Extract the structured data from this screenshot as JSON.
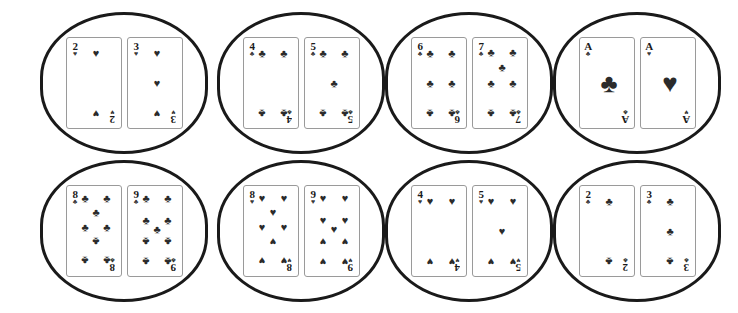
{
  "figure": {
    "background_color": "#ffffff",
    "group_outline_color": "#1a1a1a",
    "card_border_color": "#9a9a9a",
    "pip_color": "#2b2b2b",
    "rows": 2,
    "columns": 4,
    "total_groups": 8,
    "cards_per_group": 2
  },
  "suits": {
    "hearts": "♥",
    "clubs": "♣",
    "spades": "♠",
    "diamonds": "♦"
  },
  "groups": [
    {
      "id": "group-1",
      "row": 1,
      "column": 1,
      "x": 40,
      "y": 12,
      "width": 168,
      "height": 142,
      "cards": [
        {
          "rank": "2",
          "suit": "hearts",
          "suit_symbol": "♥",
          "pip_count": 2,
          "label": "2 of hearts"
        },
        {
          "rank": "3",
          "suit": "hearts",
          "suit_symbol": "♥",
          "pip_count": 3,
          "label": "3 of hearts"
        }
      ]
    },
    {
      "id": "group-2",
      "row": 1,
      "column": 2,
      "x": 217,
      "y": 12,
      "width": 168,
      "height": 142,
      "cards": [
        {
          "rank": "4",
          "suit": "clubs",
          "suit_symbol": "♣",
          "pip_count": 4,
          "label": "4 of clubs"
        },
        {
          "rank": "5",
          "suit": "clubs",
          "suit_symbol": "♣",
          "pip_count": 5,
          "label": "5 of clubs"
        }
      ]
    },
    {
      "id": "group-3",
      "row": 1,
      "column": 3,
      "x": 385,
      "y": 12,
      "width": 168,
      "height": 142,
      "cards": [
        {
          "rank": "6",
          "suit": "clubs",
          "suit_symbol": "♣",
          "pip_count": 6,
          "label": "6 of clubs"
        },
        {
          "rank": "7",
          "suit": "clubs",
          "suit_symbol": "♣",
          "pip_count": 7,
          "label": "7 of clubs"
        }
      ]
    },
    {
      "id": "group-4",
      "row": 1,
      "column": 4,
      "x": 553,
      "y": 12,
      "width": 168,
      "height": 142,
      "cards": [
        {
          "rank": "A",
          "suit": "clubs",
          "suit_symbol": "♣",
          "pip_count": 1,
          "label": "ace of clubs"
        },
        {
          "rank": "A",
          "suit": "hearts",
          "suit_symbol": "♥",
          "pip_count": 1,
          "label": "ace of hearts"
        }
      ]
    },
    {
      "id": "group-5",
      "row": 2,
      "column": 1,
      "x": 40,
      "y": 160,
      "width": 168,
      "height": 142,
      "cards": [
        {
          "rank": "8",
          "suit": "clubs",
          "suit_symbol": "♣",
          "pip_count": 8,
          "label": "8 of clubs"
        },
        {
          "rank": "9",
          "suit": "clubs",
          "suit_symbol": "♣",
          "pip_count": 9,
          "label": "9 of clubs"
        }
      ]
    },
    {
      "id": "group-6",
      "row": 2,
      "column": 2,
      "x": 217,
      "y": 160,
      "width": 168,
      "height": 142,
      "cards": [
        {
          "rank": "8",
          "suit": "hearts",
          "suit_symbol": "♥",
          "pip_count": 8,
          "label": "8 of hearts"
        },
        {
          "rank": "9",
          "suit": "hearts",
          "suit_symbol": "♥",
          "pip_count": 9,
          "label": "9 of hearts"
        }
      ]
    },
    {
      "id": "group-7",
      "row": 2,
      "column": 3,
      "x": 385,
      "y": 160,
      "width": 168,
      "height": 142,
      "cards": [
        {
          "rank": "4",
          "suit": "hearts",
          "suit_symbol": "♥",
          "pip_count": 4,
          "label": "4 of hearts"
        },
        {
          "rank": "5",
          "suit": "hearts",
          "suit_symbol": "♥",
          "pip_count": 5,
          "label": "5 of hearts"
        }
      ]
    },
    {
      "id": "group-8",
      "row": 2,
      "column": 4,
      "x": 553,
      "y": 160,
      "width": 168,
      "height": 142,
      "cards": [
        {
          "rank": "2",
          "suit": "clubs",
          "suit_symbol": "♣",
          "pip_count": 2,
          "label": "2 of clubs"
        },
        {
          "rank": "3",
          "suit": "clubs",
          "suit_symbol": "♣",
          "pip_count": 3,
          "label": "3 of clubs"
        }
      ]
    }
  ],
  "pip_layouts": {
    "1": [
      [
        50,
        50,
        "big",
        false
      ]
    ],
    "2": [
      [
        50,
        14,
        "",
        false
      ],
      [
        50,
        86,
        "",
        true
      ]
    ],
    "3": [
      [
        50,
        14,
        "",
        false
      ],
      [
        50,
        50,
        "",
        false
      ],
      [
        50,
        86,
        "",
        true
      ]
    ],
    "4": [
      [
        22,
        14,
        "",
        false
      ],
      [
        78,
        14,
        "",
        false
      ],
      [
        22,
        86,
        "",
        true
      ],
      [
        78,
        86,
        "",
        true
      ]
    ],
    "5": [
      [
        22,
        14,
        "",
        false
      ],
      [
        78,
        14,
        "",
        false
      ],
      [
        50,
        50,
        "",
        false
      ],
      [
        22,
        86,
        "",
        true
      ],
      [
        78,
        86,
        "",
        true
      ]
    ],
    "6": [
      [
        22,
        14,
        "",
        false
      ],
      [
        78,
        14,
        "",
        false
      ],
      [
        22,
        50,
        "",
        false
      ],
      [
        78,
        50,
        "",
        false
      ],
      [
        22,
        86,
        "",
        true
      ],
      [
        78,
        86,
        "",
        true
      ]
    ],
    "7": [
      [
        22,
        12,
        "",
        false
      ],
      [
        78,
        12,
        "",
        false
      ],
      [
        50,
        30,
        "",
        false
      ],
      [
        22,
        50,
        "",
        false
      ],
      [
        78,
        50,
        "",
        false
      ],
      [
        22,
        86,
        "",
        true
      ],
      [
        78,
        86,
        "",
        true
      ]
    ],
    "8": [
      [
        22,
        10,
        "",
        false
      ],
      [
        78,
        10,
        "",
        false
      ],
      [
        50,
        27,
        "",
        false
      ],
      [
        22,
        45,
        "",
        false
      ],
      [
        78,
        45,
        "",
        false
      ],
      [
        50,
        62,
        "",
        true
      ],
      [
        22,
        85,
        "",
        true
      ],
      [
        78,
        85,
        "",
        true
      ]
    ],
    "9": [
      [
        22,
        10,
        "",
        false
      ],
      [
        78,
        10,
        "",
        false
      ],
      [
        22,
        37,
        "",
        false
      ],
      [
        78,
        37,
        "",
        false
      ],
      [
        50,
        48,
        "",
        false
      ],
      [
        22,
        62,
        "",
        true
      ],
      [
        78,
        62,
        "",
        true
      ],
      [
        22,
        87,
        "",
        true
      ],
      [
        78,
        87,
        "",
        true
      ]
    ]
  }
}
